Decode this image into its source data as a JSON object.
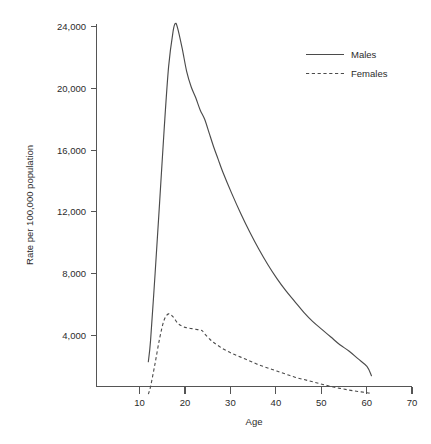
{
  "chart_data": {
    "type": "line",
    "title": "",
    "subtitle": "",
    "xlabel": "Age",
    "ylabel": "Rate per 100,000 population",
    "xlim": [
      0,
      70
    ],
    "ylim": [
      0,
      24000
    ],
    "xticks": [
      10,
      20,
      30,
      40,
      50,
      60,
      70
    ],
    "xtick_labels": [
      "10",
      "20",
      "30",
      "40",
      "50",
      "60",
      "70"
    ],
    "yticks": [
      4000,
      8000,
      12000,
      16000,
      20000,
      24000
    ],
    "ytick_labels": [
      "4,000",
      "8,000",
      "12,000",
      "16,000",
      "20,000",
      "24,000"
    ],
    "grid": false,
    "legend_position": "top-right",
    "legend": [
      "Males",
      "Females"
    ],
    "series": [
      {
        "name": "Males",
        "style": "solid",
        "color": "#4b4b4b",
        "x": [
          11.5,
          12,
          13,
          14,
          15,
          16,
          17,
          17.5,
          18,
          19,
          20,
          21,
          22,
          23,
          24,
          25,
          26,
          27,
          28,
          30,
          32,
          34,
          36,
          38,
          40,
          42,
          44,
          46,
          48,
          50,
          52,
          54,
          56,
          58,
          60,
          61
        ],
        "values": [
          2300,
          3700,
          8000,
          12600,
          17300,
          21400,
          23700,
          24200,
          23900,
          22600,
          21100,
          20100,
          19400,
          18600,
          18000,
          17100,
          16200,
          15400,
          14600,
          13200,
          11900,
          10700,
          9600,
          8600,
          7700,
          6900,
          6200,
          5500,
          4900,
          4400,
          3900,
          3400,
          3000,
          2500,
          2000,
          1400
        ]
      },
      {
        "name": "Females",
        "style": "dashed",
        "color": "#4b4b4b",
        "x": [
          11.5,
          12,
          13,
          14,
          15,
          16,
          17,
          18,
          19,
          20,
          21,
          22,
          23,
          23.5,
          24,
          25,
          26,
          28,
          30,
          32,
          34,
          36,
          38,
          40,
          42,
          44,
          46,
          48,
          50,
          52,
          54,
          56,
          58,
          60,
          61
        ],
        "values": [
          200,
          700,
          2200,
          3800,
          5000,
          5400,
          5200,
          4800,
          4600,
          4500,
          4450,
          4400,
          4350,
          4300,
          4100,
          3800,
          3550,
          3150,
          2850,
          2600,
          2350,
          2100,
          1900,
          1700,
          1500,
          1300,
          1150,
          1000,
          850,
          700,
          580,
          470,
          380,
          300,
          250
        ]
      }
    ]
  },
  "figure": {
    "name": "rate-by-age-line-chart"
  }
}
